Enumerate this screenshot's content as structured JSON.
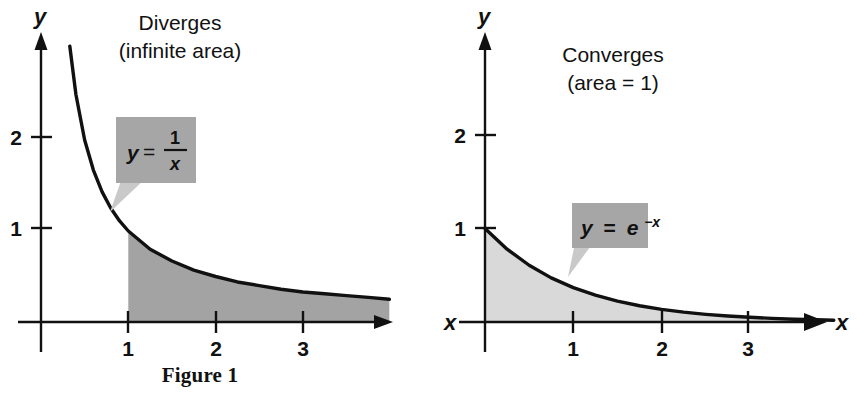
{
  "page": {
    "background": "#ffffff",
    "ink": "#111111",
    "width": 857,
    "height": 401
  },
  "figures": [
    {
      "id": "figure-1",
      "caption": "Figure 1",
      "annotation_lines": [
        "Diverges",
        "(infinite area)"
      ],
      "callout": {
        "equation_plain": "y = 1/x",
        "lhs": "y",
        "eq": "=",
        "numerator": "1",
        "denominator": "x",
        "style": "fraction",
        "box_color": "#a6a6a6",
        "tail_color": "#c9c9c9"
      },
      "axes": {
        "y_label": "y",
        "x_label": "",
        "x_ticks": [
          "1",
          "2",
          "3"
        ],
        "y_ticks": [
          "1",
          "2"
        ]
      },
      "shade_color": "#a3a3a3",
      "shade_note": "region under y = 1/x for x >= 1"
    },
    {
      "id": "figure-2",
      "caption": "Figure 2",
      "annotation_lines": [
        "Converges",
        "(area = 1)"
      ],
      "callout": {
        "equation_plain": "y = e^-x",
        "lhs": "y",
        "eq": "=",
        "base": "e",
        "exponent": "−x",
        "style": "exponent",
        "box_color": "#a6a6a6",
        "tail_color": "#c9c9c9"
      },
      "axes": {
        "y_label": "y",
        "x_label": "x",
        "x_label_left": "x",
        "x_ticks": [
          "1",
          "2",
          "3"
        ],
        "y_ticks": [
          "1",
          "2"
        ]
      },
      "shade_color": "#d9d9d9",
      "shade_note": "region under y = e^-x for x >= 0"
    }
  ],
  "chart_data": [
    {
      "type": "line",
      "title": "Figure 1",
      "function": "y = 1/x",
      "xlabel": "",
      "ylabel": "y",
      "xlim": [
        -0.18,
        3.99
      ],
      "ylim": [
        -0.42,
        3.05
      ],
      "x_ticks": [
        1,
        2,
        3
      ],
      "y_ticks": [
        1,
        2
      ],
      "grid": false,
      "legend": "none",
      "annotations": [
        "Diverges",
        "(infinite area)",
        "y = 1/x"
      ],
      "shaded_region": {
        "from": 1,
        "to": 3.99,
        "under": "y = 1/x",
        "fill": "#a3a3a3",
        "area": "infinite"
      },
      "x": [
        0.33,
        0.4,
        0.5,
        0.6,
        0.7,
        0.8,
        0.9,
        1.0,
        1.25,
        1.5,
        1.75,
        2.0,
        2.25,
        2.5,
        2.75,
        3.0,
        3.25,
        3.5,
        3.75,
        3.99
      ],
      "y": [
        3.03,
        2.5,
        2.0,
        1.67,
        1.43,
        1.25,
        1.11,
        1.0,
        0.8,
        0.67,
        0.57,
        0.5,
        0.44,
        0.4,
        0.36,
        0.33,
        0.31,
        0.29,
        0.27,
        0.25
      ]
    },
    {
      "type": "line",
      "title": "Figure 2",
      "function": "y = e^-x",
      "xlabel": "x",
      "ylabel": "y",
      "xlim": [
        -0.22,
        3.95
      ],
      "ylim": [
        -0.42,
        3.05
      ],
      "x_ticks": [
        1,
        2,
        3
      ],
      "y_ticks": [
        1,
        2
      ],
      "grid": false,
      "legend": "none",
      "annotations": [
        "Converges",
        "(area = 1)",
        "y = e^-x"
      ],
      "shaded_region": {
        "from": 0,
        "to": 3.95,
        "under": "y = e^-x",
        "fill": "#d9d9d9",
        "area": 1
      },
      "x": [
        0.0,
        0.25,
        0.5,
        0.75,
        1.0,
        1.25,
        1.5,
        1.75,
        2.0,
        2.25,
        2.5,
        2.75,
        3.0,
        3.25,
        3.5,
        3.75,
        3.95
      ],
      "y": [
        1.0,
        0.779,
        0.607,
        0.472,
        0.368,
        0.287,
        0.223,
        0.174,
        0.135,
        0.105,
        0.082,
        0.064,
        0.05,
        0.039,
        0.03,
        0.024,
        0.019
      ]
    }
  ]
}
